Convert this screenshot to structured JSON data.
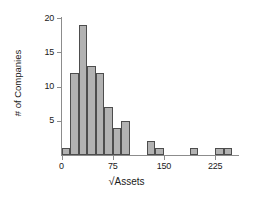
{
  "chart_data": {
    "type": "bar",
    "title": "",
    "subtitle": "",
    "xlabel": "√Assets",
    "ylabel": "# of Companies",
    "xlim": [
      -12.5,
      262.5
    ],
    "ylim": [
      0,
      20
    ],
    "grid": false,
    "legend": null,
    "bin_width": 12.5,
    "x_ticks": [
      0,
      75,
      150,
      225
    ],
    "x_tick_labels": [
      "0",
      "75",
      "150",
      "225"
    ],
    "y_ticks": [
      5,
      10,
      15,
      20
    ],
    "y_tick_labels": [
      "5",
      "10",
      "15",
      "20"
    ],
    "categories": [
      "0-12.5",
      "12.5-25",
      "25-37.5",
      "37.5-50",
      "50-62.5",
      "62.5-75",
      "75-87.5",
      "87.5-100",
      "100-112.5",
      "112.5-125",
      "125-137.5",
      "137.5-150",
      "150-162.5",
      "162.5-175",
      "175-187.5",
      "187.5-200",
      "200-212.5",
      "212.5-225",
      "225-237.5",
      "237.5-250"
    ],
    "bin_starts": [
      0,
      12.5,
      25,
      37.5,
      50,
      62.5,
      75,
      87.5,
      100,
      112.5,
      125,
      137.5,
      150,
      162.5,
      175,
      187.5,
      200,
      212.5,
      225,
      237.5
    ],
    "values": [
      1,
      12,
      19,
      13,
      12,
      7,
      4,
      5,
      0,
      0,
      2,
      1,
      0,
      0,
      0,
      1,
      0,
      0,
      1,
      1
    ],
    "bar_color": "#b2b2b2",
    "bar_edge_color": "#4d4d4d",
    "axis_color": "#8c8c8c",
    "text_color": "#1a1a1a",
    "background": "#ffffff"
  },
  "axis": {
    "x_title_radical": "√",
    "x_title_text": "Assets",
    "y_title": "# of Companies"
  }
}
